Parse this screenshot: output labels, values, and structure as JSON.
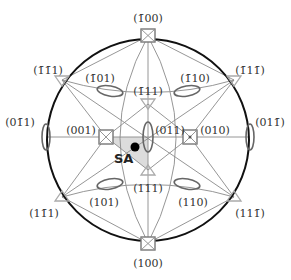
{
  "diagram": {
    "type": "stereographic-projection",
    "center": [
      148,
      140
    ],
    "radius": 101,
    "colors": {
      "primitive_circle": "#111111",
      "zone_lines": "#8a8a8a",
      "symbols": "#777777",
      "triangles": "#aaaaaa",
      "shaded_triangle": "#d9d9d9",
      "sa_point": "#000000"
    },
    "poles": [
      {
        "id": "m100",
        "label": "(1̄00)",
        "symbol": "square",
        "x": 148,
        "y": 36,
        "lx": 148,
        "ly": 20
      },
      {
        "id": "p100",
        "label": "(100)",
        "symbol": "square",
        "x": 148,
        "y": 243,
        "lx": 148,
        "ly": 268
      },
      {
        "id": "p001",
        "label": "(001)",
        "symbol": "square",
        "x": 106,
        "y": 137,
        "lx": 84,
        "ly": 132
      },
      {
        "id": "p010",
        "label": "(010)",
        "symbol": "square",
        "x": 190,
        "y": 137,
        "lx": 212,
        "ly": 132
      },
      {
        "id": "p011",
        "label": "(011)",
        "symbol": "ellipse-v",
        "x": 148,
        "y": 137,
        "lx": 168,
        "ly": 133
      },
      {
        "id": "m0m11",
        "label": "(01̄1)",
        "symbol": "ellipse-v",
        "x": 46,
        "y": 137,
        "lx": 21,
        "ly": 124
      },
      {
        "id": "p01m1",
        "label": "(011̄)",
        "symbol": "ellipse-v",
        "x": 250,
        "y": 137,
        "lx": 268,
        "ly": 124
      },
      {
        "id": "m111",
        "label": "(1̄11)",
        "symbol": "triangle",
        "x": 148,
        "y": 104,
        "lx": 148,
        "ly": 92
      },
      {
        "id": "p111",
        "label": "(111)",
        "symbol": "triangle",
        "x": 148,
        "y": 170,
        "lx": 148,
        "ly": 190
      },
      {
        "id": "mm11",
        "label": "(1̄1̄1)",
        "symbol": "triangle",
        "x": 62,
        "y": 80,
        "lx": 47,
        "ly": 72
      },
      {
        "id": "m1m1",
        "label": "(1̄11̄)",
        "symbol": "triangle",
        "x": 234,
        "y": 80,
        "lx": 250,
        "ly": 72
      },
      {
        "id": "p1m11",
        "label": "(11̄1)",
        "symbol": "triangle",
        "x": 62,
        "y": 197,
        "lx": 45,
        "ly": 215
      },
      {
        "id": "p11m1",
        "label": "(111̄)",
        "symbol": "triangle",
        "x": 234,
        "y": 197,
        "lx": 250,
        "ly": 215
      },
      {
        "id": "m101",
        "label": "(1̄01)",
        "symbol": "ellipse-h",
        "x": 110,
        "y": 91,
        "lx": 99,
        "ly": 80
      },
      {
        "id": "m110",
        "label": "(1̄10)",
        "symbol": "ellipse-h",
        "x": 187,
        "y": 91,
        "lx": 196,
        "ly": 80
      },
      {
        "id": "p101",
        "label": "(101)",
        "symbol": "ellipse-h",
        "x": 110,
        "y": 184,
        "lx": 104,
        "ly": 204
      },
      {
        "id": "p110",
        "label": "(110)",
        "symbol": "ellipse-h",
        "x": 187,
        "y": 184,
        "lx": 193,
        "ly": 204
      }
    ],
    "sa_point": {
      "label": "SA",
      "x": 135,
      "y": 147,
      "lx": 114,
      "ly": 163
    }
  }
}
